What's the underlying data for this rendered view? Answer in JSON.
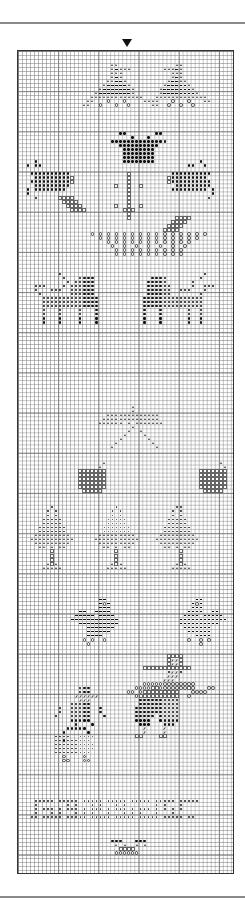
{
  "chart": {
    "title_marker": "center-arrow",
    "grid": {
      "columns": 54,
      "rows": 205,
      "cell_px": 4.02,
      "bold_every": 10
    },
    "legend_symbols": {
      "D": "dot-black",
      "s": "small-dot",
      "A": "triangle",
      "o": "open-circle",
      "q": "open-square",
      "-": "dash",
      "/": "slash"
    },
    "motifs": [
      {
        "name": "tree-left",
        "col": 16,
        "row": 3,
        "rows": [
          "       AA",
          "       A-AAA",
          "       AAA",
          "       A-A",
          "      AA--A",
          "     A-----A",
          "    A-------A",
          "   A--------A",
          "  AAAAAAAAAAAAA",
          " AA   o   o    AA",
          "AA  o   o  o     AA"
        ]
      },
      {
        "name": "tree-right",
        "col": 33,
        "row": 3,
        "rows": [
          "      AA",
          "   AAA-A",
          "     AAA",
          "     A-A",
          "    A--AA",
          "   A-----A",
          "  A-------A",
          "  A--------A",
          " AAAAAAAAAAAAA",
          "AA   o   o   AA",
          "    o  o  o"
        ]
      },
      {
        "name": "flower-top",
        "col": 21,
        "row": 20,
        "rows": [
          "    DD       DD",
          "       D   D",
          "  DDDDDDDDDDDDDD",
          "    DDDDDDDDDD",
          "     DDDDDDDD",
          "     DDDDDDDD",
          "     DDDDDDDD",
          "     DDDDDDDD"
        ]
      },
      {
        "name": "flower-left",
        "col": 2,
        "row": 27,
        "rows": [
          "  D",
          "D DD",
          "",
          " DDDDDDDDDD",
          "  DDDDDDDDDq",
          " DDDDDDDDDDq",
          "  DDDDDDDDD",
          "D DDDDDDDD",
          "D",
          "  D"
        ]
      },
      {
        "name": "flower-right",
        "col": 36,
        "row": 27,
        "rows": [
          "         D",
          "      DD  D",
          "",
          "  DDDDDDDDDD",
          " qDDDDDDDDD",
          " qDDDDDDDDDD",
          "   DDDDDDDDD",
          "  DDDDDDDDD D",
          "            D",
          "           D"
        ]
      },
      {
        "name": "stem",
        "col": 24,
        "row": 30,
        "rows": [
          "   q",
          "   q",
          "   q",
          "q  q  q",
          "   q",
          "   q",
          "   q",
          "   q",
          "q  q  q",
          "  qqq",
          "   q",
          "   q"
        ]
      },
      {
        "name": "stem-leaves",
        "col": 10,
        "row": 36,
        "rows": [
          "qqqq",
          " qqqq",
          "  qqqq",
          "   qqqq",
          "",
          "                             qqqq",
          "                            qqqq",
          "                           qqqq",
          "                          qqqq"
        ]
      },
      {
        "name": "basket",
        "col": 18,
        "row": 45,
        "rows": [
          "o o o o o o o o o o o o o o o",
          "  o o o o o o o o o o o o o",
          "    o o o o o o o o o o o",
          "     o  o  o  o  o  o  o",
          "      o o o o o o o o o",
          "      o o o o o o o o o"
        ]
      },
      {
        "name": "reindeer-left",
        "col": 4,
        "row": 55,
        "rows": [
          "      D",
          "       D   DDDD",
          "        D DDDDD",
          "DDD    D DDDDDD",
          "D   DDD  DDDDDD",
          " D       DDDDDD",
          "  DDDDDDDDDDDDDD",
          "  DDDDDDDDDDDDDD",
          "  DDDDDDDDDDDDDD",
          "  D   D    D   D",
          "  D   D    D   D",
          "  D   D    D   D",
          "  D   D    D   D"
        ]
      },
      {
        "name": "reindeer-right",
        "col": 30,
        "row": 55,
        "rows": [
          "                D",
          "   DDDD        D",
          "  DDDDD      D",
          "  DDDDDD     D  DDD",
          "  DDDDDD  DDD   D",
          "  DDDDDD       D",
          " DDDDDDDDDDDDDDD",
          " DDDDDDDDDDDDDDD",
          " DDDDDDDDDDDDDDD",
          " D   D      D  D",
          " D   D      D  D",
          " D   D      D  D",
          " D   D      D  D"
        ]
      },
      {
        "name": "angel-star",
        "col": 18,
        "row": 88,
        "rows": [
          "          A",
          "          A",
          "    AAAAAAAAAAAAA",
          "   AAAAAAAAAAAAAA",
          "  AAAAAA A AAAAAAA",
          "          A",
          "         A  A",
          "        A    A",
          "       A      A",
          "      A        A",
          "     A          A"
        ]
      },
      {
        "name": "gifts",
        "col": 13,
        "row": 102,
        "rows": [
          "        A                            A",
          "       A                              A",
          "  qqqqqqq                       qqqqqqq",
          "  qqqqqqq                       qqqqqqq",
          "  qqqqqqq                       qqqqqqq",
          "  qqqqqqq                       qqqqqqq",
          "  qqqqqqq                       qqqqqqq",
          "   qqqqq                         qqqqq"
        ]
      },
      {
        "name": "trees-row",
        "col": 3,
        "row": 113,
        "rows": [
          "     s               s              ss",
          "    s s             s s            s s",
          "    s s             s s            s s",
          "   sssss           sssss          sssss",
          "   sssss           sssss          sssss",
          "  sssssss         sssssss        sssssss",
          "  sssssss         sssssss        sssssss",
          " AAAAAAAAA       AAAAAAAAA      AAAAAAAAA",
          "AAAAAAAAAAA     AAAAAAAAAAA    AAAAAAAAAAA",
          " AAAAAAAAA       AAAAAAAAA      AAAAAAAAA",
          "  AA A AA         AA A AA        AA A AA",
          "     q               q               q",
          "     q               q               q",
          "     q               q               q",
          "    AqA             AqA             AqA",
          "   AAAAA           AAAAA           AAAAA"
        ]
      },
      {
        "name": "bells",
        "col": 11,
        "row": 136,
        "rows": [
          "         --                      --",
          "         -o-                    -o-",
          "         ---                    ---",
          "    --  ----                   ----  --",
          "   ----- ----                 ---- -----",
          "  ------------               ------------",
          "    ----------               ----------",
          "      -------                 -------",
          "      ------                   ------",
          "      ----                       ----",
          "     o o  o                    o  o o",
          "      o                           o"
        ]
      },
      {
        "name": "gingerbread-left",
        "col": 7,
        "row": 158,
        "rows": [
          "        DDD",
          "        DDD",
          "       //////",
          "        ///",
          "      DDDDD",
          "   D  DDDDD  D",
          "   D  DDDDD  D",
          "  D   DDDDD   D",
          "      DDDDD",
          "       D   D",
          "     DDDDD",
          "    D     D",
          "  ssss  ssss",
          "  ssDssssss",
          "  ssssssssss",
          "  ssssssssss",
          "  sssssssss",
          "    o    o",
          "    oo   oo"
        ]
      },
      {
        "name": "gingerbread-right",
        "col": 27,
        "row": 150,
        "rows": [
          "          qqqq",
          "          q//q",
          "          q//q",
          "    qqqqqqqqqqqq",
          "          D//D",
          "          ///",
          "         ///",
          "    ooooooooooooo",
          "  ooooqqoooooooqo   oo",
          "oo oqqqqqqqqq   oooo",
          "  oqqqqqqqqqq  o",
          "   DDDDDDDDDD",
          "   DDDDDDDDDD",
          "  DDDDDDDDDDD",
          "  DDDDDDDDDDD",
          "  DDDDD DDDDD",
          "  DDDD  DDDDD",
          "   DDD   DDD",
          "    /    /",
          "    /    /",
          "  qq    qq"
        ]
      },
      {
        "name": "border-band",
        "col": 3,
        "row": 186,
        "rows": [
          " sssss sssss sssss sssss sssss sssss sssss",
          " s       s s   s s   s s       s s   s",
          " s sss s sss s sss s sss s sss s s s s",
          " s   s s   s s s   s   s s s   s   s",
          "ss sssss sssss sssss sssss sssss sssss ss"
        ]
      },
      {
        "name": "bottom-cluster",
        "col": 21,
        "row": 196,
        "rows": [
          "  DDD   DDD",
          "   A A  A A",
          "    qqqq",
          "   oooooo"
        ]
      }
    ]
  }
}
